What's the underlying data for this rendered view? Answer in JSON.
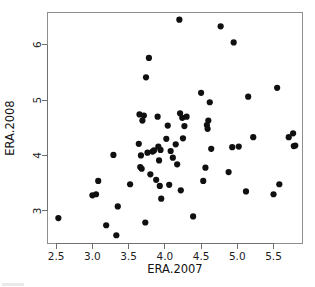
{
  "chart_data": {
    "type": "scatter",
    "title": "",
    "xlabel": "ERA.2007",
    "ylabel": "ERA.2008",
    "xlim": [
      2.38,
      5.9
    ],
    "ylim": [
      2.42,
      6.58
    ],
    "xticks": [
      2.5,
      3.0,
      3.5,
      4.0,
      4.5,
      5.0,
      5.5
    ],
    "xticklabels": [
      "2.5",
      "3.0",
      "3.5",
      "4.0",
      "4.5",
      "5.0",
      "5.5"
    ],
    "yticks": [
      3,
      4,
      5,
      6
    ],
    "yticklabels": [
      "3",
      "4",
      "5",
      "6"
    ],
    "grid": false,
    "legend": null,
    "marker": "filled-circle",
    "marker_color": "#101010",
    "marker_size": 3.1,
    "n_points": 68,
    "points": [
      [
        2.53,
        2.87
      ],
      [
        3.0,
        3.28
      ],
      [
        3.05,
        3.3
      ],
      [
        3.08,
        3.54
      ],
      [
        3.19,
        2.74
      ],
      [
        3.29,
        4.01
      ],
      [
        3.33,
        2.56
      ],
      [
        3.35,
        3.08
      ],
      [
        3.52,
        3.48
      ],
      [
        3.64,
        4.21
      ],
      [
        3.65,
        4.74
      ],
      [
        3.66,
        3.79
      ],
      [
        3.67,
        4.0
      ],
      [
        3.68,
        3.76
      ],
      [
        3.69,
        4.63
      ],
      [
        3.71,
        4.72
      ],
      [
        3.73,
        2.79
      ],
      [
        3.74,
        5.41
      ],
      [
        3.76,
        4.05
      ],
      [
        3.78,
        5.76
      ],
      [
        3.8,
        3.66
      ],
      [
        3.83,
        4.07
      ],
      [
        3.85,
        4.09
      ],
      [
        3.88,
        3.56
      ],
      [
        3.9,
        4.7
      ],
      [
        3.91,
        4.16
      ],
      [
        3.92,
        3.91
      ],
      [
        3.93,
        3.45
      ],
      [
        3.94,
        4.1
      ],
      [
        3.95,
        3.22
      ],
      [
        4.02,
        4.3
      ],
      [
        4.04,
        4.54
      ],
      [
        4.06,
        3.47
      ],
      [
        4.08,
        4.08
      ],
      [
        4.11,
        3.96
      ],
      [
        4.15,
        4.2
      ],
      [
        4.17,
        3.84
      ],
      [
        4.2,
        6.45
      ],
      [
        4.21,
        4.76
      ],
      [
        4.22,
        3.37
      ],
      [
        4.24,
        4.68
      ],
      [
        4.25,
        4.31
      ],
      [
        4.27,
        4.53
      ],
      [
        4.3,
        4.7
      ],
      [
        4.39,
        2.9
      ],
      [
        4.5,
        5.13
      ],
      [
        4.53,
        3.54
      ],
      [
        4.56,
        3.78
      ],
      [
        4.58,
        4.55
      ],
      [
        4.59,
        4.48
      ],
      [
        4.6,
        4.63
      ],
      [
        4.62,
        4.96
      ],
      [
        4.64,
        4.12
      ],
      [
        4.77,
        6.33
      ],
      [
        4.88,
        3.7
      ],
      [
        4.93,
        4.15
      ],
      [
        4.95,
        6.04
      ],
      [
        5.02,
        4.16
      ],
      [
        5.12,
        3.35
      ],
      [
        5.15,
        5.06
      ],
      [
        5.22,
        4.33
      ],
      [
        5.5,
        3.3
      ],
      [
        5.55,
        5.22
      ],
      [
        5.58,
        3.48
      ],
      [
        5.71,
        4.33
      ],
      [
        5.77,
        4.4
      ],
      [
        5.78,
        4.17
      ],
      [
        5.8,
        4.18
      ]
    ]
  },
  "axes": {
    "x_title": "ERA.2007",
    "y_title": "ERA.2008"
  }
}
